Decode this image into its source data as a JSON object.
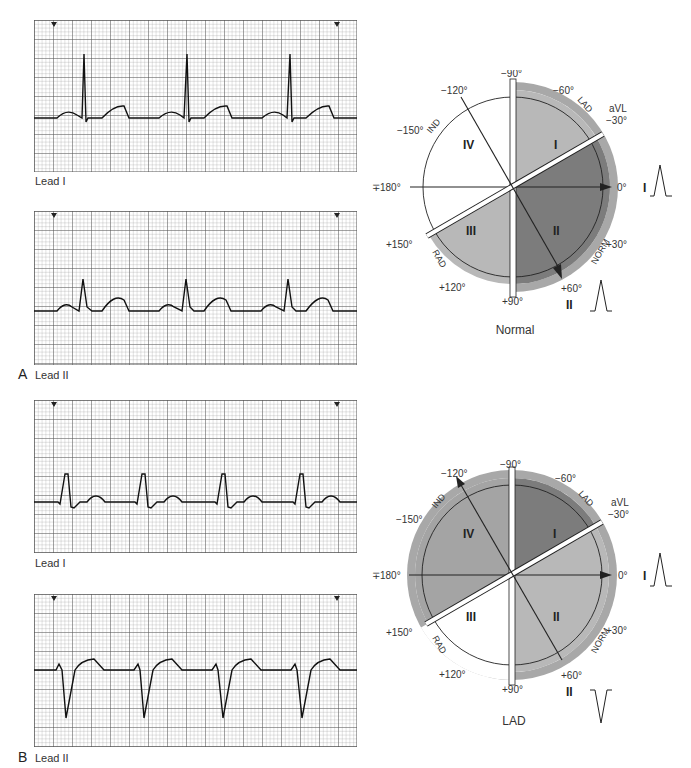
{
  "panels": [
    {
      "letter": "A",
      "strips": [
        {
          "lead": "Lead I",
          "beats": 3,
          "morphology": "upright-narrow-qrs"
        },
        {
          "lead": "Lead II",
          "beats": 3,
          "morphology": "upright-small-qrs"
        }
      ],
      "axis": {
        "caption": "Normal",
        "shading": {
          "quadrant_I": "#b8b8b8",
          "quadrant_II": "#7c7c7c",
          "quadrant_III": "#b8b8b8",
          "quadrant_IV": "#ffffff",
          "norm_wedge": "#7c7c7c",
          "rim": "#a8a8a8"
        },
        "lead_I_deflection": "positive",
        "lead_II_deflection": "positive"
      }
    },
    {
      "letter": "B",
      "strips": [
        {
          "lead": "Lead I",
          "beats": 4,
          "morphology": "upright-wide-qrs"
        },
        {
          "lead": "Lead II",
          "beats": 4,
          "morphology": "negative-deep-qrs"
        }
      ],
      "axis": {
        "caption": "LAD",
        "shading": {
          "quadrant_I": "#7c7c7c",
          "quadrant_II": "#b8b8b8",
          "quadrant_III": "#ffffff",
          "quadrant_IV": "#a4a4a4",
          "rim": "#a8a8a8"
        },
        "lead_I_deflection": "positive",
        "lead_II_deflection": "negative"
      }
    }
  ],
  "axis_labels": {
    "minus90": "−90°",
    "minus60": "−60°",
    "minus30": "−30°",
    "aVL": "aVL",
    "zero": "0°",
    "plus30": "+30°",
    "plus60": "+60°",
    "plus90": "+90°",
    "plus120": "+120°",
    "plus150": "+150°",
    "pm180": "∓180°",
    "minus150": "−150°",
    "minus120": "−120°",
    "lead_I": "I",
    "lead_II": "II",
    "quadrants": [
      "I",
      "II",
      "III",
      "IV"
    ],
    "arcs": {
      "LAD": "LAD",
      "NORM": "NORM",
      "RAD": "RAD",
      "IND": "IND"
    }
  },
  "colors": {
    "grid_minor": "#9a9a9a",
    "grid_major": "#444444",
    "trace": "#111111"
  }
}
